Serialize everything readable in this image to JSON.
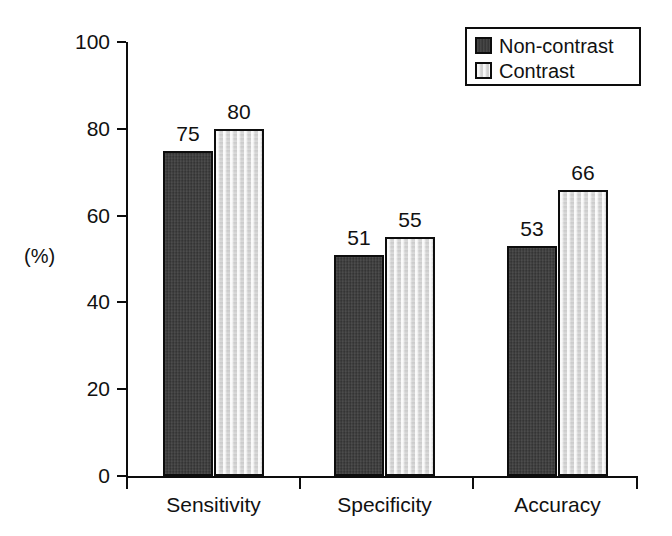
{
  "chart_data": {
    "type": "bar",
    "title": "",
    "xlabel": "",
    "ylabel": "(%)",
    "ylim": [
      0,
      100
    ],
    "ytick_values": [
      0,
      20,
      40,
      60,
      80,
      100
    ],
    "ytick_labels": [
      "0",
      "20",
      "40",
      "60",
      "80",
      "100"
    ],
    "grid": false,
    "legend_position": "top-right",
    "categories": [
      "Sensitivity",
      "Specificity",
      "Accuracy"
    ],
    "series": [
      {
        "name": "Non-contrast",
        "color": "#3b3b3b",
        "values": [
          75,
          51,
          53
        ],
        "value_labels": [
          "75",
          "51",
          "53"
        ]
      },
      {
        "name": "Contrast",
        "color": "#d9d9d9",
        "values": [
          80,
          55,
          66
        ],
        "value_labels": [
          "80",
          "55",
          "66"
        ]
      }
    ]
  },
  "axis": {
    "unit_label": "(%)",
    "line_color": "#0d0d0d"
  },
  "legend": {
    "border_color": "#0d0d0d",
    "items": [
      {
        "label": "Non-contrast",
        "swatch": "dark"
      },
      {
        "label": "Contrast",
        "swatch": "light"
      }
    ]
  }
}
